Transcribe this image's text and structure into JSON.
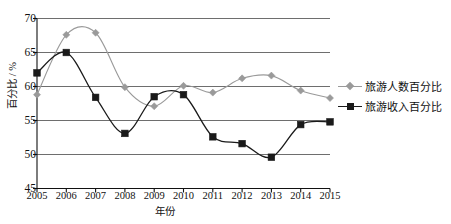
{
  "chart_data": {
    "type": "line",
    "title": "",
    "subtitle": "",
    "xlabel": "年份",
    "ylabel": "百分比 / %",
    "categories": [
      "2005",
      "2006",
      "2007",
      "2008",
      "2009",
      "2010",
      "2011",
      "2012",
      "2013",
      "2014",
      "2015"
    ],
    "x": [
      2005,
      2006,
      2007,
      2008,
      2009,
      2010,
      2011,
      2012,
      2013,
      2014,
      2015
    ],
    "ylim": [
      45,
      70
    ],
    "yticks": [
      45,
      50,
      55,
      60,
      65,
      70
    ],
    "grid": "horizontal",
    "legend_position": "right",
    "series": [
      {
        "name": "旅游人数百分比",
        "marker": "diamond",
        "color": "#9a9a9a",
        "values": [
          58.8,
          67.6,
          67.9,
          59.9,
          57.1,
          60.1,
          59.1,
          61.2,
          61.6,
          59.4,
          58.3
        ]
      },
      {
        "name": "旅游收入百分比",
        "marker": "square",
        "color": "#1a1a1a",
        "values": [
          62.0,
          65.0,
          58.4,
          53.1,
          58.5,
          58.8,
          52.6,
          51.6,
          49.6,
          54.4,
          54.8
        ]
      }
    ]
  },
  "axis": {
    "y_title": "百分比 / %",
    "x_title": "年份",
    "y_tick_labels": [
      "70",
      "65",
      "60",
      "55",
      "50",
      "45"
    ],
    "x_tick_labels": [
      "2005",
      "2006",
      "2007",
      "2008",
      "2009",
      "2010",
      "2011",
      "2012",
      "2013",
      "2014",
      "2015"
    ]
  },
  "legend": {
    "items": [
      {
        "label": "旅游人数百分比",
        "marker": "diamond-marker",
        "color": "#9a9a9a"
      },
      {
        "label": "旅游收入百分比",
        "marker": "square-marker",
        "color": "#1a1a1a"
      }
    ]
  },
  "colors": {
    "series_gray": "#9a9a9a",
    "series_black": "#1a1a1a",
    "gridline": "#6e6e6e",
    "axis": "#111111",
    "background": "#ffffff"
  }
}
